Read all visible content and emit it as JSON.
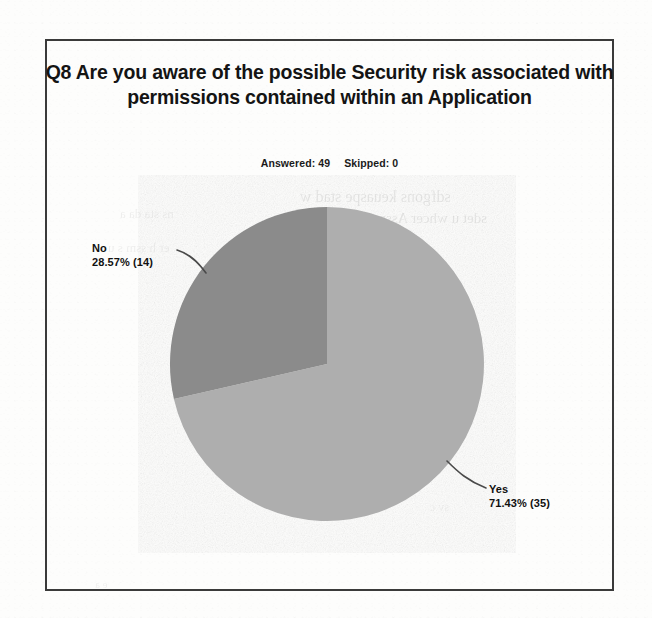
{
  "chart": {
    "title": "Q8 Are you aware of the possible Security risk associated with permissions contained within an Application",
    "answered_label": "Answered: 49",
    "skipped_label": "Skipped: 0",
    "colors": {
      "yes_slice": "#aeaeae",
      "no_slice": "#8b8b8b",
      "frame_border": "#3a3a3a",
      "leader_line": "#4a4a4a",
      "text": "#141414",
      "page_background": "#fdfdfc"
    },
    "labels": {
      "no": {
        "name": "No",
        "value": "28.57% (14)"
      },
      "yes": {
        "name": "Yes",
        "value": "71.43% (35)"
      }
    }
  },
  "bleed_through": {
    "a": "sdfgons keuaspe stad w",
    "b": "sdet u  whcer Assm sdue sf  haft  n",
    "c": "ns   sta da a",
    "d": "er  h ssm s u",
    "e": "sv c",
    "f": "e a"
  },
  "chart_data": {
    "type": "pie",
    "title": "Q8 Are you aware of the possible Security risk associated with permissions contained within an Application",
    "subtitle": "Answered: 49   Skipped: 0",
    "answered": 49,
    "skipped": 0,
    "total": 49,
    "legend": "none",
    "labels_position": "outside-with-leader-lines",
    "start_angle_deg": 0,
    "direction": "clockwise",
    "categories": [
      "Yes",
      "No"
    ],
    "values": [
      35,
      14
    ],
    "percentages": [
      71.43,
      28.57
    ],
    "slice_colors": [
      "#aeaeae",
      "#8b8b8b"
    ],
    "data_labels": [
      "Yes\n71.43% (35)",
      "No\n28.57% (14)"
    ]
  }
}
